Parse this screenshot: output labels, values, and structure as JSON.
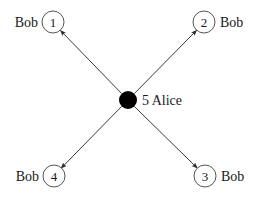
{
  "canvas": {
    "width": 263,
    "height": 199,
    "background": "#ffffff"
  },
  "style": {
    "edge_color": "#3a3a3a",
    "edge_width": 1,
    "circle_stroke": "#555555",
    "circle_fill": "#ffffff",
    "center_fill": "#000000",
    "text_color": "#1a1a1a"
  },
  "center_node": {
    "id": "alice",
    "number": "5",
    "name": "Alice",
    "label": "5  Alice",
    "cx": 128,
    "cy": 100,
    "r": 9,
    "label_x": 142,
    "label_y": 105,
    "filled": true
  },
  "peers": [
    {
      "id": "peer-1",
      "number": "1",
      "name": "Bob",
      "cx": 53,
      "cy": 22,
      "r": 11,
      "num_x": 53,
      "num_y": 27,
      "name_x": 38,
      "name_y": 27,
      "name_anchor": "end"
    },
    {
      "id": "peer-2",
      "number": "2",
      "name": "Bob",
      "cx": 204,
      "cy": 22,
      "r": 11,
      "num_x": 204,
      "num_y": 27,
      "name_x": 220,
      "name_y": 27,
      "name_anchor": "start"
    },
    {
      "id": "peer-3",
      "number": "3",
      "name": "Bob",
      "cx": 205,
      "cy": 176,
      "r": 11,
      "num_x": 205,
      "num_y": 181,
      "name_x": 221,
      "name_y": 181,
      "name_anchor": "start"
    },
    {
      "id": "peer-4",
      "number": "4",
      "name": "Bob",
      "cx": 54,
      "cy": 176,
      "r": 11,
      "num_x": 54,
      "num_y": 181,
      "name_x": 39,
      "name_y": 181,
      "name_anchor": "end"
    }
  ],
  "edges": [
    {
      "id": "edge-alice-1",
      "from": "alice",
      "to": "peer-1",
      "x1": 121.6,
      "y1": 93.5,
      "x2": 60.3,
      "y2": 30.3,
      "directed": true
    },
    {
      "id": "edge-alice-2",
      "from": "alice",
      "to": "peer-2",
      "x1": 134.4,
      "y1": 93.5,
      "x2": 196.8,
      "y2": 30.1,
      "directed": true
    },
    {
      "id": "edge-alice-3",
      "from": "alice",
      "to": "peer-3",
      "x1": 134.4,
      "y1": 106.5,
      "x2": 197.4,
      "y2": 168.2,
      "directed": true
    },
    {
      "id": "edge-alice-4",
      "from": "alice",
      "to": "peer-4",
      "x1": 121.6,
      "y1": 106.5,
      "x2": 61.0,
      "y2": 168.3,
      "directed": true
    }
  ]
}
